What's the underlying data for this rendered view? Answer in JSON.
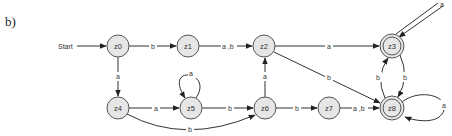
{
  "figure": {
    "label": "b)",
    "start_label": "Start"
  },
  "states": [
    {
      "id": "z0",
      "label": "z0",
      "accepting": false,
      "start": true
    },
    {
      "id": "z1",
      "label": "z1",
      "accepting": false
    },
    {
      "id": "z2",
      "label": "z2",
      "accepting": false
    },
    {
      "id": "z3",
      "label": "z3",
      "accepting": true
    },
    {
      "id": "z4",
      "label": "z4",
      "accepting": false
    },
    {
      "id": "z5",
      "label": "z5",
      "accepting": false
    },
    {
      "id": "z6",
      "label": "z6",
      "accepting": false
    },
    {
      "id": "z7",
      "label": "z7",
      "accepting": false
    },
    {
      "id": "z8",
      "label": "z8",
      "accepting": true
    }
  ],
  "transitions": [
    {
      "from": "z0",
      "to": "z1",
      "label": "b"
    },
    {
      "from": "z0",
      "to": "z4",
      "label": "a"
    },
    {
      "from": "z1",
      "to": "z2",
      "label": "a ,b"
    },
    {
      "from": "z2",
      "to": "z3",
      "label": "a"
    },
    {
      "from": "z2",
      "to": "z8",
      "label": "b"
    },
    {
      "from": "z3",
      "to": "z3",
      "label": "a"
    },
    {
      "from": "z3",
      "to": "z8",
      "label": "b"
    },
    {
      "from": "z8",
      "to": "z3",
      "label": "b"
    },
    {
      "from": "z4",
      "to": "z5",
      "label": "a"
    },
    {
      "from": "z4",
      "to": "z6",
      "label": "b"
    },
    {
      "from": "z5",
      "to": "z5",
      "label": "a"
    },
    {
      "from": "z5",
      "to": "z6",
      "label": "b"
    },
    {
      "from": "z6",
      "to": "z2",
      "label": "a"
    },
    {
      "from": "z6",
      "to": "z7",
      "label": "b"
    },
    {
      "from": "z7",
      "to": "z8",
      "label": "a ,b"
    },
    {
      "from": "z8",
      "to": "z8",
      "label": "a"
    }
  ],
  "colors": {
    "node_fill": "#e6e6e6",
    "node_stroke": "#555555",
    "edge": "#333333"
  }
}
